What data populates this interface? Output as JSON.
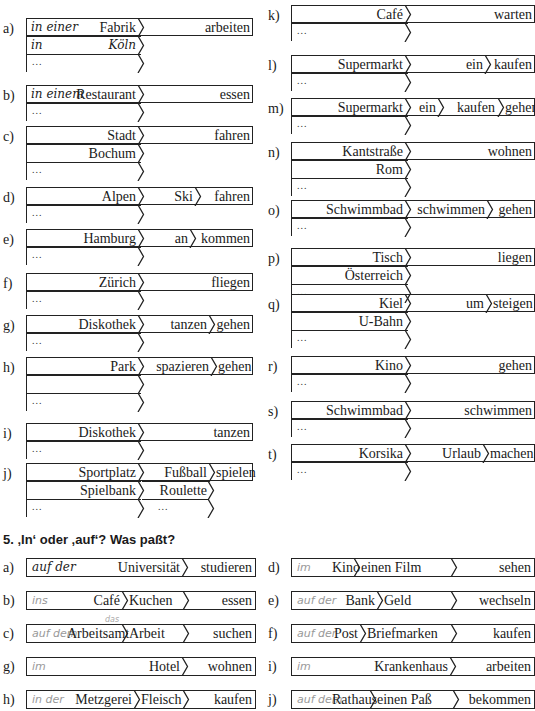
{
  "cutoff_heading": "",
  "section4": {
    "left": [
      {
        "label": "a)",
        "rows": [
          {
            "hand": "in einer",
            "place": "Fabrik",
            "verb": "arbeiten"
          },
          {
            "hand": "in",
            "place": "Köln",
            "place_hand": true
          },
          {
            "dots": "..."
          }
        ]
      },
      {
        "label": "b)",
        "rows": [
          {
            "hand": "in einem",
            "place": "Restaurant",
            "verb": "essen"
          },
          {
            "dots": "..."
          }
        ]
      },
      {
        "label": "c)",
        "rows": [
          {
            "place": "Stadt",
            "verb": "fahren"
          },
          {
            "place": "Bochum"
          },
          {
            "dots": "..."
          }
        ]
      },
      {
        "label": "d)",
        "rows": [
          {
            "place": "Alpen",
            "mid": "Ski",
            "verb": "fahren"
          },
          {
            "dots": "..."
          }
        ]
      },
      {
        "label": "e)",
        "rows": [
          {
            "place": "Hamburg",
            "mid": "an",
            "verb": "kommen"
          },
          {
            "dots": "..."
          }
        ]
      },
      {
        "label": "f)",
        "rows": [
          {
            "place": "Zürich",
            "verb": "fliegen"
          },
          {
            "dots": "..."
          }
        ]
      },
      {
        "label": "g)",
        "rows": [
          {
            "place": "Diskothek",
            "mid": "tanzen",
            "verb": "gehen"
          },
          {
            "dots": "..."
          }
        ]
      },
      {
        "label": "h)",
        "rows": [
          {
            "place": "Park",
            "mid": "spazieren",
            "verb": "gehen"
          },
          {},
          {
            "dots": "..."
          }
        ]
      },
      {
        "label": "i)",
        "rows": [
          {
            "place": "Diskothek",
            "verb": "tanzen"
          },
          {
            "dots": "..."
          }
        ]
      },
      {
        "label": "j)",
        "rows": [
          {
            "place": "Sportplatz",
            "mid": "Fußball",
            "verb": "spielen"
          },
          {
            "place": "Spielbank",
            "mid": "Roulette"
          },
          {
            "dots": "...",
            "mid_dots": "..."
          }
        ]
      }
    ],
    "right": [
      {
        "label": "k)",
        "rows": [
          {
            "place": "Café",
            "verb": "warten"
          },
          {
            "dots": "..."
          }
        ]
      },
      {
        "label": "l)",
        "rows": [
          {
            "place": "Supermarkt",
            "mid": "ein",
            "verb": "kaufen"
          },
          {
            "dots": "..."
          }
        ]
      },
      {
        "label": "m)",
        "rows": [
          {
            "place": "Supermarkt",
            "mid": "ein",
            "mid2": "kaufen",
            "verb": "gehen"
          },
          {
            "dots": "..."
          }
        ]
      },
      {
        "label": "n)",
        "rows": [
          {
            "place": "Kantstraße",
            "verb": "wohnen"
          },
          {
            "place": "Rom"
          },
          {
            "dots": "..."
          }
        ]
      },
      {
        "label": "o)",
        "rows": [
          {
            "place": "Schwimmbad",
            "mid": "schwimmen",
            "verb": "gehen"
          },
          {
            "dots": "..."
          }
        ]
      },
      {
        "label": "p)",
        "rows": [
          {
            "place": "Tisch",
            "verb": "liegen"
          },
          {
            "place": "Österreich"
          },
          {
            "dots": "..."
          }
        ]
      },
      {
        "label": "q)",
        "rows": [
          {
            "place": "Kiel",
            "mid": "um",
            "verb": "steigen"
          },
          {
            "place": "U-Bahn"
          },
          {
            "dots": "..."
          }
        ]
      },
      {
        "label": "r)",
        "rows": [
          {
            "place": "Kino",
            "verb": "gehen"
          },
          {
            "dots": "..."
          }
        ]
      },
      {
        "label": "s)",
        "rows": [
          {
            "place": "Schwimmbad",
            "verb": "schwimmen"
          },
          {
            "dots": "..."
          }
        ]
      },
      {
        "label": "t)",
        "rows": [
          {
            "place": "Korsika",
            "mid": "Urlaub",
            "verb": "machen"
          },
          {
            "dots": "..."
          }
        ]
      }
    ]
  },
  "section5": {
    "title": "5.  ‚In‘ oder ‚auf‘? Was paßt?",
    "left": [
      {
        "label": "a)",
        "answer": "auf der",
        "answer_ink": true,
        "place": "Universität",
        "obj": "",
        "verb": "studieren"
      },
      {
        "label": "b)",
        "answer": "ins",
        "place": "Café",
        "obj": "Kuchen",
        "verb": "essen"
      },
      {
        "label": "c)",
        "answer": "auf dem",
        "above": "das",
        "place": "Arbeitsamt",
        "obj": "Arbeit",
        "verb": "suchen"
      },
      {
        "label": "g)",
        "answer": "im",
        "place": "Hotel",
        "obj": "",
        "verb": "wohnen"
      },
      {
        "label": "h)",
        "answer": "in der",
        "place": "Metzgerei",
        "obj": "Fleisch",
        "verb": "kaufen"
      }
    ],
    "right": [
      {
        "label": "d)",
        "answer": "im",
        "place": "Kino",
        "obj": "einen Film",
        "verb": "sehen"
      },
      {
        "label": "e)",
        "answer": "auf der",
        "place": "Bank",
        "obj": "Geld",
        "verb": "wechseln"
      },
      {
        "label": "f)",
        "answer": "auf der",
        "place": "Post",
        "obj": "Briefmarken",
        "verb": "kaufen"
      },
      {
        "label": "i)",
        "answer": "im",
        "place": "Krankenhaus",
        "obj": "",
        "verb": "arbeiten"
      },
      {
        "label": "j)",
        "answer": "auf dem",
        "place": "Rathaus",
        "obj": "einen Paß",
        "verb": "bekommen"
      }
    ]
  }
}
